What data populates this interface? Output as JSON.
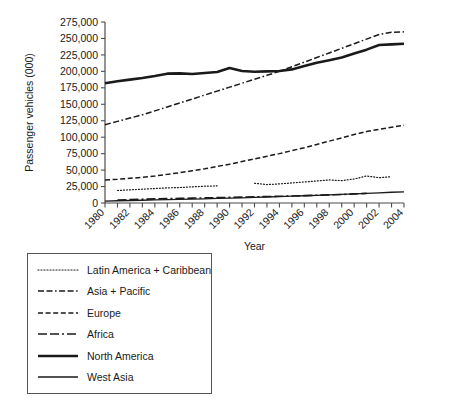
{
  "chart_data": {
    "type": "line",
    "title": "",
    "xlabel": "Year",
    "ylabel": "Passenger vehicles (000)",
    "xlim": [
      1980,
      2004
    ],
    "ylim": [
      0,
      275000
    ],
    "ytick_step": 25000,
    "grid": false,
    "legend_position": "below-left",
    "x": [
      1980,
      1981,
      1982,
      1983,
      1984,
      1985,
      1986,
      1987,
      1988,
      1989,
      1990,
      1991,
      1992,
      1993,
      1994,
      1995,
      1996,
      1997,
      1998,
      1999,
      2000,
      2001,
      2002,
      2003,
      2004
    ],
    "ytick_labels": [
      "0",
      "25,000",
      "50,000",
      "75,000",
      "100,000",
      "125,000",
      "150,000",
      "175,000",
      "200,000",
      "225,000",
      "250,000",
      "275,000"
    ],
    "ytick_values": [
      0,
      25000,
      50000,
      75000,
      100000,
      125000,
      150000,
      175000,
      200000,
      225000,
      250000,
      275000
    ],
    "xtick_labels": [
      "1980",
      "1982",
      "1984",
      "1986",
      "1988",
      "1990",
      "1992",
      "1994",
      "1996",
      "1998",
      "2000",
      "2002",
      "2004"
    ],
    "xtick_values": [
      1980,
      1982,
      1984,
      1986,
      1988,
      1990,
      1992,
      1994,
      1996,
      1998,
      2000,
      2002,
      2004
    ],
    "series": [
      {
        "name": "Latin America + Caribbean",
        "style": "dotted",
        "width": 1.2,
        "color": "#1a1a1a",
        "x": [
          1981,
          1982,
          1983,
          1984,
          1985,
          1986,
          1987,
          1988,
          1989,
          null,
          1992,
          1993,
          1994,
          1995,
          1996,
          1997,
          1998,
          1999,
          2000,
          2001,
          2002,
          2003
        ],
        "values": [
          19000,
          20000,
          21000,
          22000,
          23000,
          23500,
          24500,
          25500,
          26000,
          null,
          30000,
          28000,
          29000,
          30500,
          32000,
          33500,
          35000,
          34000,
          36500,
          41000,
          38500,
          40000
        ]
      },
      {
        "name": "Asia + Pacific",
        "style": "dashdot",
        "width": 1.5,
        "color": "#1a1a1a",
        "x": [
          1980,
          1981,
          1982,
          1983,
          1984,
          1985,
          1986,
          1987,
          1988,
          1989,
          1990,
          1991,
          1992,
          1993,
          1994,
          1995,
          1996,
          1997,
          1998,
          1999,
          2000,
          2001,
          2002,
          2003,
          2004
        ],
        "values": [
          119000,
          124000,
          129000,
          134000,
          140000,
          146000,
          152000,
          158000,
          164000,
          170000,
          176000,
          182000,
          188000,
          194000,
          200000,
          207000,
          214000,
          221000,
          228000,
          235000,
          242000,
          249000,
          256000,
          259500,
          260000
        ]
      },
      {
        "name": "Europe",
        "style": "dashed-short",
        "width": 1.5,
        "color": "#1a1a1a",
        "x": [
          1980,
          1981,
          1982,
          1983,
          1984,
          1985,
          1986,
          1987,
          1988,
          1989,
          1990,
          1991,
          1992,
          1993,
          1994,
          1995,
          1996,
          1997,
          1998,
          1999,
          2000,
          2001,
          2002,
          2003,
          2004
        ],
        "values": [
          35000,
          36000,
          37500,
          39000,
          41000,
          43500,
          46000,
          49000,
          52000,
          55500,
          59000,
          63000,
          67000,
          71000,
          75000,
          79500,
          84000,
          89000,
          94000,
          99000,
          104000,
          108500,
          112000,
          115000,
          118000
        ]
      },
      {
        "name": "Africa",
        "style": "dashed-long",
        "width": 1.6,
        "color": "#1a1a1a",
        "x": [
          1981,
          1982,
          1983,
          1984,
          1985,
          1986,
          1987,
          1988,
          1989,
          1990,
          1991,
          1992,
          1993,
          1994,
          1995,
          1996,
          1997,
          1998,
          1999,
          2000,
          2001
        ],
        "values": [
          4500,
          5200,
          5800,
          6200,
          6600,
          7000,
          7400,
          7800,
          8200,
          8600,
          9000,
          9400,
          9800,
          10200,
          10700,
          11200,
          11800,
          12400,
          13000,
          13800,
          14600
        ]
      },
      {
        "name": "North America",
        "style": "solid-thick",
        "width": 2.6,
        "color": "#1a1a1a",
        "x": [
          1980,
          1981,
          1982,
          1983,
          1984,
          1985,
          1986,
          1987,
          1988,
          1989,
          1990,
          1991,
          1992,
          1993,
          1994,
          1995,
          1996,
          1997,
          1998,
          1999,
          2000,
          2001,
          2002,
          2003,
          2004
        ],
        "values": [
          182000,
          185000,
          187500,
          190000,
          193000,
          196500,
          197000,
          196000,
          197500,
          199000,
          205000,
          200500,
          199500,
          200000,
          200500,
          203000,
          208000,
          213000,
          217000,
          221000,
          227000,
          233000,
          240000,
          241000,
          242000
        ]
      },
      {
        "name": "West Asia",
        "style": "solid-thin",
        "width": 1.3,
        "color": "#1a1a1a",
        "x": [
          1980,
          1981,
          1982,
          1983,
          1984,
          1985,
          1986,
          1987,
          1988,
          1989,
          1990,
          1991,
          1992,
          1993,
          1994,
          1995,
          1996,
          1997,
          1998,
          1999,
          2000,
          2001,
          2002,
          2003,
          2004
        ],
        "values": [
          3000,
          3400,
          3800,
          4200,
          4600,
          5000,
          5400,
          5900,
          6400,
          6900,
          7400,
          7900,
          8500,
          9100,
          9700,
          10300,
          11000,
          11700,
          12400,
          13100,
          13900,
          14700,
          15500,
          16300,
          17000
        ]
      }
    ]
  },
  "legend": {
    "items": [
      {
        "label": "Latin America + Caribbean",
        "style": "dotted"
      },
      {
        "label": "Asia + Pacific",
        "style": "dashdot"
      },
      {
        "label": "Europe",
        "style": "dashed-short"
      },
      {
        "label": "Africa",
        "style": "dashed-long"
      },
      {
        "label": "North America",
        "style": "solid-thick"
      },
      {
        "label": "West Asia",
        "style": "solid-thin"
      }
    ]
  },
  "colors": {
    "line": "#1a1a1a",
    "axis": "#4d4d4d",
    "legend_border": "#555555",
    "background": "#ffffff"
  }
}
